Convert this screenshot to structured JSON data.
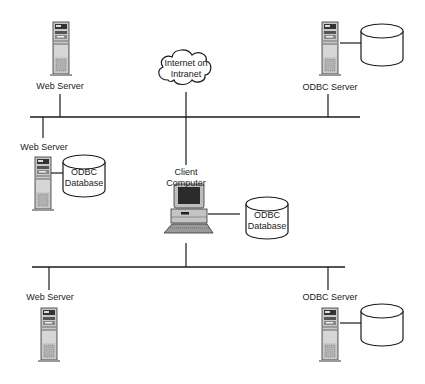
{
  "diagram": {
    "cloud": {
      "line1": "Internet on",
      "line2": "Intranet"
    },
    "top_segment": {
      "web_server": {
        "label": "Web Server"
      },
      "odbc_server": {
        "label": "ODBC Server"
      },
      "web_server_db": {
        "label": "Web Server",
        "db_line1": "ODBC",
        "db_line2": "Database"
      }
    },
    "client": {
      "line1": "Client",
      "line2": "Computer",
      "db_line1": "ODBC",
      "db_line2": "Database"
    },
    "bottom_segment": {
      "web_server": {
        "label": "Web Server"
      },
      "odbc_server": {
        "label": "ODBC Server"
      }
    },
    "colors": {
      "line": "#1a1a1a",
      "device_gray": "#bdbdbd",
      "device_dark": "#3a3a3a",
      "background": "#ffffff"
    }
  }
}
